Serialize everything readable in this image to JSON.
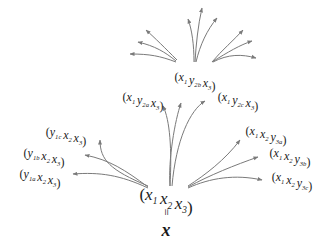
{
  "diagram": {
    "root": {
      "label": [
        {
          "v": "x",
          "s": "1"
        },
        {
          "v": "x",
          "s": "2"
        },
        {
          "v": "x",
          "s": "3"
        }
      ],
      "equals": "=",
      "vector": "x"
    },
    "neighbors": [
      {
        "id": "y1a",
        "label": [
          {
            "v": "y",
            "s": "1a"
          },
          {
            "v": "x",
            "s": "2"
          },
          {
            "v": "x",
            "s": "3"
          }
        ]
      },
      {
        "id": "y1b",
        "label": [
          {
            "v": "y",
            "s": "1b"
          },
          {
            "v": "x",
            "s": "2"
          },
          {
            "v": "x",
            "s": "3"
          }
        ]
      },
      {
        "id": "y1c",
        "label": [
          {
            "v": "y",
            "s": "1c"
          },
          {
            "v": "x",
            "s": "2"
          },
          {
            "v": "x",
            "s": "3"
          }
        ]
      },
      {
        "id": "y2a",
        "label": [
          {
            "v": "x",
            "s": "1"
          },
          {
            "v": "y",
            "s": "2a"
          },
          {
            "v": "x",
            "s": "3"
          }
        ]
      },
      {
        "id": "y2b",
        "label": [
          {
            "v": "x",
            "s": "1"
          },
          {
            "v": "y",
            "s": "2b"
          },
          {
            "v": "x",
            "s": "3"
          }
        ]
      },
      {
        "id": "y2c",
        "label": [
          {
            "v": "x",
            "s": "1"
          },
          {
            "v": "y",
            "s": "2c"
          },
          {
            "v": "x",
            "s": "3"
          }
        ]
      },
      {
        "id": "y3a",
        "label": [
          {
            "v": "x",
            "s": "1"
          },
          {
            "v": "x",
            "s": "2"
          },
          {
            "v": "y",
            "s": "3a"
          }
        ]
      },
      {
        "id": "y3b",
        "label": [
          {
            "v": "x",
            "s": "1"
          },
          {
            "v": "x",
            "s": "2"
          },
          {
            "v": "y",
            "s": "3b"
          }
        ]
      },
      {
        "id": "y3c",
        "label": [
          {
            "v": "x",
            "s": "1"
          },
          {
            "v": "x",
            "s": "2"
          },
          {
            "v": "y",
            "s": "3c"
          }
        ]
      }
    ],
    "colors": {
      "edge": "#7a7a7a",
      "text": "#1a1a1a"
    }
  }
}
